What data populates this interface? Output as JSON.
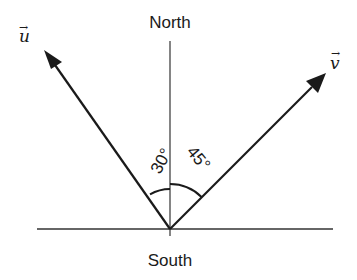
{
  "diagram": {
    "labels": {
      "north": "North",
      "south": "South",
      "vector_u": "u",
      "vector_v": "v",
      "vector_arrow": "→",
      "angle_u": "30°",
      "angle_v": "45°"
    },
    "geometry": {
      "origin": [
        170,
        229
      ],
      "vector_u": {
        "angle_from_north_deg": 30,
        "direction": "north-west",
        "tip": [
          45,
          51
        ]
      },
      "vector_v": {
        "angle_from_north_deg": 45,
        "direction": "north-east",
        "tip": [
          325,
          74
        ]
      }
    },
    "colors": {
      "line": "#1a1a1a",
      "axis": "#333333",
      "background": "#ffffff"
    }
  }
}
